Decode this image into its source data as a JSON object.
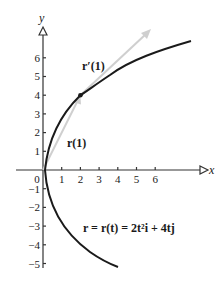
{
  "figure": {
    "axes": {
      "x_label": "x",
      "y_label": "y",
      "x_ticks": [
        "0",
        "1",
        "2",
        "3",
        "4",
        "5",
        "6"
      ],
      "y_ticks_positive": [
        "1",
        "2",
        "3",
        "4",
        "5",
        "6"
      ],
      "y_ticks_negative": [
        "−1",
        "−2",
        "−3",
        "−4",
        "−5"
      ]
    },
    "labels": {
      "position_vector": "r(1)",
      "tangent_vector": "r′(1)",
      "equation": "r = r(t) = 2t²i + 4tj"
    },
    "colors": {
      "curve": "#1a1a1a",
      "vectors": "#c8c8c8",
      "axes": "#333333"
    },
    "point": {
      "x": 2,
      "y": 4
    }
  }
}
